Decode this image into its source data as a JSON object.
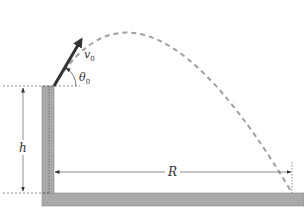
{
  "diagram": {
    "labels": {
      "velocity": "v",
      "velocity_sub": "0",
      "angle": "θ",
      "angle_sub": "0",
      "height": "h",
      "range": "R"
    },
    "colors": {
      "tower": "#a9a9a9",
      "ground": "#a9a9a9",
      "trajectory": "#a0a0a0",
      "arrow": "#333333",
      "guide_lines": "#444444"
    },
    "geometry": {
      "launch_point": [
        54,
        86
      ],
      "landing_point": [
        292,
        193
      ],
      "apex": [
        142,
        13
      ],
      "tower": {
        "x": 42,
        "y": 86,
        "width": 12,
        "height": 107
      },
      "ground": {
        "x": 42,
        "y": 193,
        "width": 262,
        "height": 13
      }
    }
  }
}
